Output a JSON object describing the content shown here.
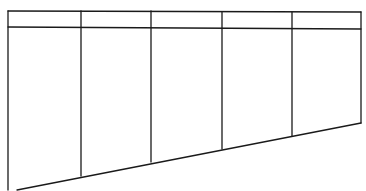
{
  "diagram": {
    "type": "blank-table-form",
    "stroke_color": "#1a1a1a",
    "background_color": "#ffffff",
    "columns": 5,
    "header_rows": 1,
    "header_cells": [
      "",
      "",
      "",
      "",
      ""
    ],
    "body_cells": [
      "",
      "",
      "",
      "",
      ""
    ],
    "outline": {
      "top_left": [
        8,
        11
      ],
      "top_right": [
        361,
        12
      ],
      "bottom_right": [
        361,
        73
      ],
      "bottom_left": [
        8,
        190
      ],
      "bottom_edge_start": [
        17,
        190
      ]
    },
    "header_line_y_left": 27,
    "header_line_y_right": 29,
    "column_dividers": [
      {
        "x": 81,
        "bottom_y": 179
      },
      {
        "x": 152,
        "bottom_y": 164
      },
      {
        "x": 222,
        "bottom_y": 150
      },
      {
        "x": 292,
        "bottom_y": 136
      }
    ]
  }
}
